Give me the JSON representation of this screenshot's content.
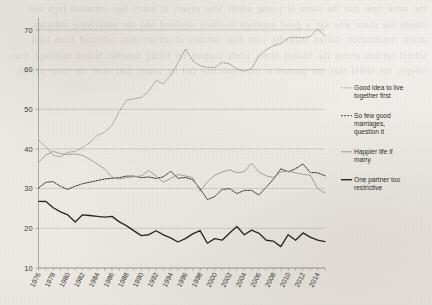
{
  "chart_data": {
    "type": "line",
    "title": "",
    "subtitle": "",
    "xlabel": "",
    "ylabel": "",
    "xlim": [
      1976,
      2015
    ],
    "ylim": [
      10,
      72
    ],
    "yticks": [
      10,
      20,
      30,
      40,
      50,
      60,
      70
    ],
    "xticks": [
      1976,
      1978,
      1980,
      1982,
      1984,
      1986,
      1988,
      1990,
      1992,
      1994,
      1996,
      1998,
      2000,
      2002,
      2004,
      2006,
      2008,
      2010,
      2012,
      2014
    ],
    "xtick_labels": [
      "1976",
      "1978",
      "1980",
      "1982",
      "1984",
      "1986",
      "1988",
      "1990",
      "1992",
      "1994",
      "1996",
      "1998",
      "2000",
      "2002",
      "2004",
      "2006",
      "2008",
      "2010",
      "2012",
      "2014"
    ],
    "grid": "horizontal",
    "legend_position": "right",
    "x": [
      1976,
      1977,
      1978,
      1979,
      1980,
      1981,
      1982,
      1983,
      1984,
      1985,
      1986,
      1987,
      1988,
      1989,
      1990,
      1991,
      1992,
      1993,
      1994,
      1995,
      1996,
      1997,
      1998,
      1999,
      2000,
      2001,
      2002,
      2003,
      2004,
      2005,
      2006,
      2007,
      2008,
      2009,
      2010,
      2011,
      2012,
      2013,
      2014,
      2015
    ],
    "series": [
      {
        "name": "Good idea to live together first",
        "style": "dashed",
        "color": "#9a9893",
        "values": [
          42.2,
          40.6,
          38.4,
          38.0,
          39.2,
          39.4,
          40.4,
          41.6,
          43.4,
          44.2,
          46.0,
          49.4,
          52.2,
          52.6,
          53.0,
          54.6,
          57.2,
          56.4,
          58.6,
          61.8,
          65.2,
          62.2,
          61.0,
          60.6,
          60.6,
          61.8,
          61.4,
          60.2,
          59.6,
          60.2,
          63.4,
          65.0,
          66.0,
          66.6,
          68.0,
          68.2,
          68.0,
          68.4,
          70.2,
          68.6
        ]
      },
      {
        "name": "So few good marriages, question it",
        "style": "dashed",
        "color": "#2b2926",
        "values": [
          30.2,
          31.6,
          31.8,
          30.6,
          29.8,
          30.6,
          31.2,
          31.6,
          32.0,
          32.4,
          32.6,
          32.8,
          33.2,
          33.2,
          32.8,
          33.0,
          32.6,
          33.0,
          34.4,
          32.6,
          32.8,
          32.2,
          30.0,
          27.2,
          28.0,
          29.8,
          30.0,
          28.8,
          29.6,
          29.6,
          28.4,
          30.4,
          32.4,
          35.0,
          34.2,
          35.0,
          36.2,
          34.0,
          34.0,
          33.2
        ]
      },
      {
        "name": "Happier life if marry",
        "style": "solid",
        "color": "#9a9893",
        "values": [
          36.6,
          38.4,
          39.4,
          38.8,
          38.6,
          38.8,
          38.4,
          37.4,
          36.2,
          35.0,
          33.0,
          32.4,
          32.8,
          33.0,
          33.2,
          34.6,
          33.2,
          31.6,
          32.6,
          33.6,
          33.2,
          32.8,
          29.4,
          31.8,
          33.4,
          34.2,
          34.8,
          34.0,
          34.2,
          36.4,
          34.2,
          33.2,
          32.8,
          34.2,
          34.4,
          34.0,
          33.6,
          33.4,
          30.0,
          29.0
        ]
      },
      {
        "name": "One partner too restrictive",
        "style": "solid",
        "color": "#201e1c",
        "values": [
          26.8,
          26.8,
          25.2,
          24.2,
          23.4,
          21.6,
          23.4,
          23.2,
          23.0,
          22.8,
          23.0,
          21.6,
          20.6,
          19.4,
          18.2,
          18.4,
          19.4,
          18.4,
          17.6,
          16.6,
          17.4,
          18.6,
          19.4,
          16.2,
          17.4,
          17.0,
          18.8,
          20.4,
          18.4,
          19.6,
          18.8,
          17.0,
          16.8,
          15.4,
          18.4,
          17.0,
          18.8,
          17.8,
          17.0,
          16.6
        ]
      }
    ],
    "legend_entries": [
      {
        "label_line_1": "Good idea to live",
        "label_line_2": "together first",
        "style": "dashed",
        "color": "#9a9893"
      },
      {
        "label_line_1": "So few good",
        "label_line_2": "marriages,",
        "label_line_3": "question it",
        "style": "dashed",
        "color": "#2b2926"
      },
      {
        "label_line_1": "Happier life if",
        "label_line_2": "marry",
        "style": "solid",
        "color": "#9a9893"
      },
      {
        "label_line_1": "One partner too",
        "label_line_2": "restrictive",
        "style": "solid",
        "color": "#201e1c"
      }
    ]
  },
  "background": {
    "bleed_text": "the same time that the share of young adults who expect to marry has remained high and steady the share who say a good marriage is likely declined and the underlying attitudes about cohabitation shifted markedly over four decades of survey data collected from high school seniors across the United States while support for living together before marriage rose steeply the belief that one partner is too restrictive fell by nearly half over the same period"
  },
  "colors": {
    "paper": "#f2f0ec",
    "grid": "#9c9a95",
    "axis": "#86847f",
    "ink_black": "#201e1c",
    "ink_gray": "#9a9893"
  }
}
